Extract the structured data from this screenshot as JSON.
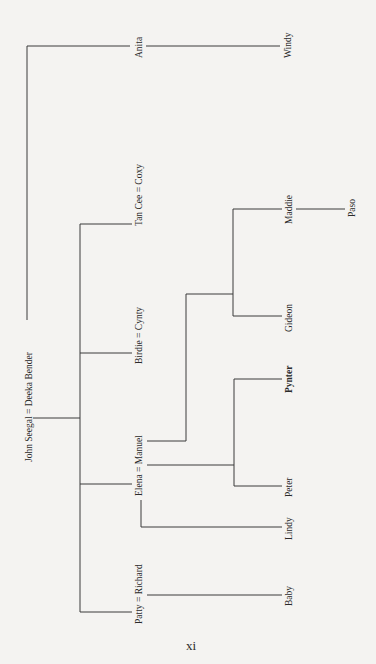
{
  "diagram": {
    "type": "family-tree",
    "orientation": "rotated-90-ccw",
    "generations": [
      {
        "level": 1,
        "couples": [
          {
            "label": "John Seegal = Deeka Bender"
          }
        ]
      },
      {
        "level": 2,
        "members": [
          {
            "label": "Anita"
          },
          {
            "label": "Tan Cee = Coxy"
          },
          {
            "label": "Birdie = Cynty"
          },
          {
            "label": "Elena = Manuel"
          },
          {
            "label": "Patty = Richard"
          }
        ]
      },
      {
        "level": 3,
        "members": [
          {
            "label": "Windy",
            "parent": "Anita"
          },
          {
            "label": "Maddie",
            "parent": "Manuel"
          },
          {
            "label": "Gideon",
            "parent": "Manuel"
          },
          {
            "label": "Pynter",
            "parent": "Elena = Manuel",
            "emphasis": "bold"
          },
          {
            "label": "Peter",
            "parent": "Elena = Manuel"
          },
          {
            "label": "Lindy",
            "parent": "Elena"
          },
          {
            "label": "Baby",
            "parent": "Patty = Richard"
          }
        ]
      },
      {
        "level": 4,
        "members": [
          {
            "label": "Paso",
            "parent": "Maddie"
          }
        ]
      }
    ]
  },
  "labels": {
    "root": "John Seegal = Deeka Bender",
    "anita": "Anita",
    "windy": "Windy",
    "tancee": "Tan Cee = Coxy",
    "birdie": "Birdie = Cynty",
    "elena": "Elena = Manuel",
    "patty": "Patty = Richard",
    "maddie": "Maddie",
    "paso": "Paso",
    "gideon": "Gideon",
    "pynter": "Pynter",
    "peter": "Peter",
    "lindy": "Lindy",
    "baby": "Baby"
  },
  "page_number": "xi",
  "colors": {
    "background": "#f4f3f1",
    "line": "#3a3a3a",
    "text": "#2a2a2a"
  }
}
